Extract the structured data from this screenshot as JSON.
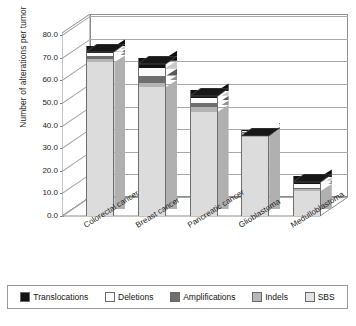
{
  "chart_data": {
    "type": "bar",
    "subtype": "stacked-column-3d",
    "title": "",
    "xlabel": "",
    "ylabel": "Number of alterations per tumor",
    "ylim": [
      0,
      80
    ],
    "ytick_step": 10,
    "ytick_labels": [
      "80.0",
      "70.0",
      "60.0",
      "50.0",
      "40.0",
      "30.0",
      "20.0",
      "10.0",
      "0.0"
    ],
    "ytick_values": [
      80,
      70,
      60,
      50,
      40,
      30,
      20,
      10,
      0
    ],
    "grid": true,
    "legend_position": "bottom",
    "categories": [
      "Colorectal cancer",
      "Breast cancer",
      "Pancreatic cancer",
      "Glioblastoma",
      "Medulloblastoma"
    ],
    "series": [
      {
        "name": "SBS",
        "color": "#dcdcdc",
        "values": [
          68.0,
          57.0,
          46.0,
          35.5,
          11.0
        ]
      },
      {
        "name": "Indels",
        "color": "#b4b4b4",
        "values": [
          1.5,
          2.0,
          2.0,
          1.0,
          1.0
        ]
      },
      {
        "name": "Amplifications",
        "color": "#6e6e6e",
        "values": [
          1.0,
          3.0,
          2.0,
          0.5,
          0.5
        ]
      },
      {
        "name": "Deletions",
        "color": "#fafafa",
        "values": [
          1.5,
          3.5,
          2.0,
          0.5,
          1.5
        ]
      },
      {
        "name": "Translocations",
        "color": "#121212",
        "values": [
          3.0,
          4.5,
          3.5,
          0.5,
          3.5
        ]
      }
    ],
    "totals": [
      75.0,
      70.0,
      55.5,
      38.0,
      17.5
    ],
    "stack_order_bottom_to_top": [
      "SBS",
      "Indels",
      "Amplifications",
      "Deletions",
      "Translocations"
    ]
  },
  "legend": {
    "items": [
      {
        "label": "Translocations",
        "color": "#121212"
      },
      {
        "label": "Deletions",
        "color": "#fbfbfb"
      },
      {
        "label": "Amplifications",
        "color": "#6e6e6e"
      },
      {
        "label": "Indels",
        "color": "#b8b8b8"
      },
      {
        "label": "SBS",
        "color": "#e2e2e2"
      }
    ]
  },
  "colors": {
    "axis": "#8c8c8c",
    "grid": "#a8a8a8",
    "text": "#1c1c1c",
    "plot_background": "#ffffff"
  }
}
